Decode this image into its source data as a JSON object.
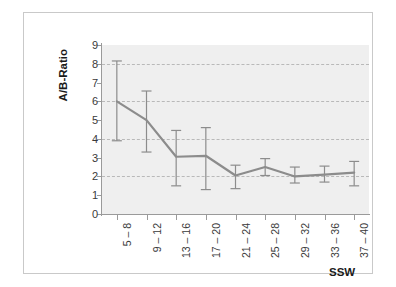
{
  "figure": {
    "background_color": "#ffffff",
    "frame_border_color": "#c9c9c9",
    "plot_background_color": "#efefef",
    "gridline_color": "#b9b9b9",
    "series_color": "#8c8c8c",
    "axis_color": "#9a9a9a",
    "text_color": "#3a3a3a"
  },
  "chart_data": {
    "type": "line",
    "title": "",
    "xlabel": "SSW",
    "ylabel": "A/B-Ratio",
    "categories": [
      "5 – 8",
      "9 – 12",
      "13 – 16",
      "17 – 20",
      "21 – 24",
      "25 – 28",
      "29 – 32",
      "33 – 36",
      "37 – 40"
    ],
    "values": [
      6.0,
      5.0,
      3.05,
      3.1,
      2.05,
      2.5,
      2.0,
      2.1,
      2.2
    ],
    "error_low": [
      3.9,
      3.3,
      1.5,
      1.3,
      1.35,
      2.05,
      1.65,
      1.7,
      1.5
    ],
    "error_high": [
      8.15,
      6.55,
      4.45,
      4.6,
      2.6,
      2.95,
      2.5,
      2.55,
      2.8
    ],
    "ylim": [
      0,
      9
    ],
    "yticks": [
      0,
      1,
      2,
      3,
      4,
      5,
      6,
      7,
      8,
      9
    ],
    "ytick_labels": [
      "0",
      "1",
      "2",
      "3",
      "4",
      "5",
      "6",
      "7",
      "8",
      "9"
    ],
    "gridlines_y": [
      2,
      4,
      6,
      8
    ],
    "grid": true,
    "grid_style": "dashed",
    "legend": false,
    "legend_position": "none",
    "error_bars": true,
    "marker": "none"
  }
}
